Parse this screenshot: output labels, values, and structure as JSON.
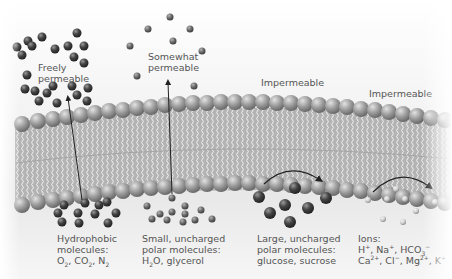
{
  "diagram": {
    "colors": {
      "head_fill": "#9a9a9a",
      "head_highlight": "#d8d8d8",
      "tail_stroke": "#ffffff",
      "bilayer_bg": "#b9b9b9",
      "dark_molecule": "#3f3f3f",
      "medium_molecule": "#6f6f6f",
      "ion_fill": "#cfcfcf",
      "label_text": "#555555",
      "arrow": "#222222"
    },
    "permeability_labels": {
      "freely": [
        "Freely",
        "permeable"
      ],
      "somewhat": [
        "Somewhat",
        "permeable"
      ],
      "impermeable_1": "Impermeable",
      "impermeable_2": "Impermeable"
    },
    "molecule_groups": [
      {
        "id": "hydrophobic",
        "lines": [
          "Hydrophobic",
          "molecules:"
        ],
        "formula_parts": [
          "O",
          "2",
          ", CO",
          "2",
          ", N",
          "2"
        ],
        "crosses_membrane": true
      },
      {
        "id": "small-polar",
        "lines": [
          "Small, uncharged",
          "polar molecules:"
        ],
        "formula_parts": [
          "H",
          "2",
          "O, glycerol"
        ],
        "crosses_membrane": true
      },
      {
        "id": "large-polar",
        "lines": [
          "Large, uncharged",
          "polar molecules:",
          "glucose, sucrose"
        ],
        "crosses_membrane": false
      },
      {
        "id": "ions",
        "lines": [
          "Ions:"
        ],
        "ion_line_1": [
          "H",
          "+",
          ", Na",
          "+",
          ", HCO",
          "3",
          "−"
        ],
        "ion_line_2": [
          "Ca",
          "2+",
          ", Cl",
          "−",
          ", Mg",
          "2+",
          ", K",
          "+"
        ],
        "crosses_membrane": false
      }
    ]
  }
}
